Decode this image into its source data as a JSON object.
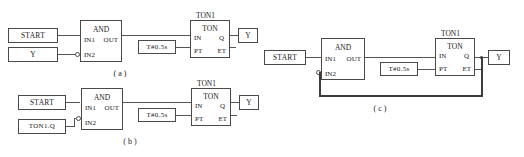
{
  "figure": {
    "kind": "function-block-diagram",
    "standard_note": "IEC 61131-3 FBD",
    "captions": {
      "a": "( a )",
      "b": "( b )",
      "c": "( c )"
    }
  },
  "common": {
    "and_block": {
      "title": "AND",
      "in1": "IN1",
      "in2": "IN2",
      "out": "OUT"
    },
    "ton_block": {
      "instance": "TON1",
      "title": "TON",
      "in": "IN",
      "q": "Q",
      "pt": "PT",
      "et": "ET"
    },
    "timer_const": "T#0.5s",
    "output_coil": "Y",
    "start_input": "START"
  },
  "diagram_a": {
    "caption": "( a )",
    "inputs": [
      {
        "label": "START",
        "pin": "IN1",
        "inverted": false
      },
      {
        "label": "Y",
        "pin": "IN2",
        "inverted": true
      }
    ],
    "and_title": "AND",
    "and_in1": "IN1",
    "and_in2": "IN2",
    "and_out": "OUT",
    "ton_instance": "TON1",
    "ton_title": "TON",
    "ton_in": "IN",
    "ton_q": "Q",
    "ton_pt": "PT",
    "ton_et": "ET",
    "preset": "T#0.5s",
    "output": "Y"
  },
  "diagram_b": {
    "caption": "( b )",
    "inputs": [
      {
        "label": "START",
        "pin": "IN1",
        "inverted": false
      },
      {
        "label": "TON1.Q",
        "pin": "IN2",
        "inverted": true
      }
    ],
    "and_title": "AND",
    "and_in1": "IN1",
    "and_in2": "IN2",
    "and_out": "OUT",
    "ton_instance": "TON1",
    "ton_title": "TON",
    "ton_in": "IN",
    "ton_q": "Q",
    "ton_pt": "PT",
    "ton_et": "ET",
    "preset": "T#0.5s",
    "output": "Y"
  },
  "diagram_c": {
    "caption": "( c )",
    "inputs": [
      {
        "label": "START",
        "pin": "IN1",
        "inverted": false
      }
    ],
    "feedback": "Q output routed back to inverted IN2",
    "and_title": "AND",
    "and_in1": "IN1",
    "and_in2": "IN2",
    "and_out": "OUT",
    "ton_instance": "TON1",
    "ton_title": "TON",
    "ton_in": "IN",
    "ton_q": "Q",
    "ton_pt": "PT",
    "ton_et": "ET",
    "preset": "T#0.5s",
    "output": "Y"
  },
  "colors": {
    "stroke": "#4a4a4a",
    "wire": "#555555",
    "feedback_wire": "#3c3c3c",
    "text": "#1a1a1a",
    "background": "#ffffff"
  }
}
